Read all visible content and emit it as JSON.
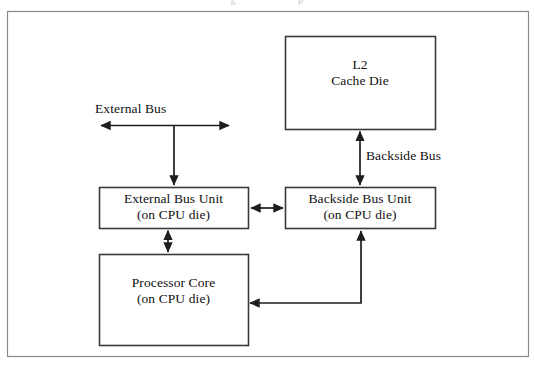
{
  "figure": {
    "frame": {
      "label": "diagram-frame"
    },
    "cropped_caption_fragment": "g                         p"
  },
  "boxes": [
    {
      "id": "l2-cache-die",
      "lines": "L2\nCache Die",
      "x": 285,
      "y": 36,
      "w": 150,
      "h": 93,
      "text_x": 285,
      "text_y": 57,
      "text_w": 150
    },
    {
      "id": "external-bus-unit",
      "lines": "External Bus Unit\n(on CPU die)",
      "x": 99,
      "y": 187,
      "w": 149,
      "h": 41,
      "text_x": 99,
      "text_y": 191,
      "text_w": 149
    },
    {
      "id": "backside-bus-unit",
      "lines": "Backside Bus Unit\n(on CPU die)",
      "x": 285,
      "y": 187,
      "w": 150,
      "h": 41,
      "text_x": 285,
      "text_y": 191,
      "text_w": 150
    },
    {
      "id": "processor-core",
      "lines": "Processor Core\n(on CPU die)",
      "x": 99,
      "y": 254,
      "w": 149,
      "h": 91,
      "text_x": 99,
      "text_y": 275,
      "text_w": 149
    }
  ],
  "edge_labels": [
    {
      "id": "external-bus",
      "text": "External Bus",
      "x": 95,
      "y": 101
    },
    {
      "id": "backside-bus",
      "text": "Backside Bus",
      "x": 366,
      "y": 148
    }
  ],
  "colors": {
    "stroke": "#3a3a3a",
    "frame_stroke": "#8a8a8a",
    "background": "#ffffff",
    "text": "#111111"
  },
  "connections": [
    {
      "id": "external-bus-arrow",
      "type": "double-horizontal",
      "from": "left-edge",
      "to": "right-edge"
    },
    {
      "id": "external-bus-to-ebu",
      "type": "single-down",
      "from": "external-bus",
      "to": "external-bus-unit"
    },
    {
      "id": "ebu-to-bbu",
      "type": "double-horizontal",
      "from": "external-bus-unit",
      "to": "backside-bus-unit"
    },
    {
      "id": "ebu-to-core",
      "type": "double-vertical",
      "from": "external-bus-unit",
      "to": "processor-core"
    },
    {
      "id": "bbu-to-l2",
      "type": "double-vertical",
      "from": "backside-bus-unit",
      "to": "l2-cache-die"
    },
    {
      "id": "core-to-bbu",
      "type": "double-elbow",
      "from": "processor-core",
      "to": "backside-bus-unit"
    }
  ]
}
